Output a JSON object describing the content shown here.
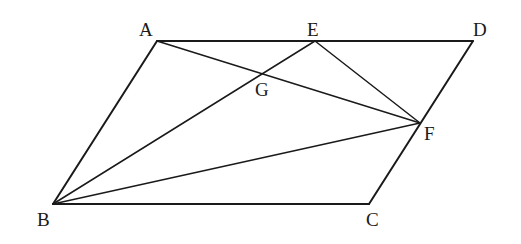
{
  "diagram": {
    "type": "geometry",
    "points": {
      "A": {
        "label": "A"
      },
      "B": {
        "label": "B"
      },
      "C": {
        "label": "C"
      },
      "D": {
        "label": "D"
      },
      "E": {
        "label": "E"
      },
      "F": {
        "label": "F"
      },
      "G": {
        "label": "G"
      }
    },
    "segments": [
      [
        "A",
        "D"
      ],
      [
        "D",
        "C"
      ],
      [
        "C",
        "B"
      ],
      [
        "B",
        "A"
      ],
      [
        "A",
        "F"
      ],
      [
        "B",
        "E"
      ],
      [
        "B",
        "F"
      ],
      [
        "E",
        "F"
      ]
    ]
  }
}
